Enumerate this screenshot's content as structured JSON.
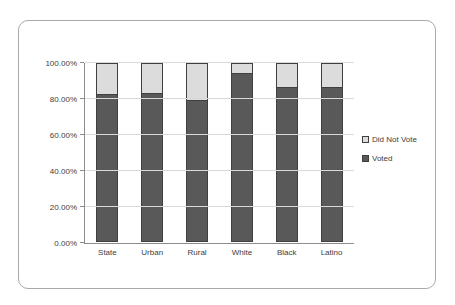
{
  "figure": {
    "kind": "embedded-chart-figure",
    "background_color": "#ffffff",
    "frame_border_color": "#a9a9a9"
  },
  "chart_data": {
    "type": "bar",
    "subtype": "stacked-100-percent",
    "title": "",
    "xlabel": "",
    "ylabel": "",
    "categories": [
      "State",
      "Urban",
      "Rural",
      "White",
      "Black",
      "Latino"
    ],
    "series": [
      {
        "name": "Voted",
        "color": "#595959",
        "values": [
          82,
          83,
          79,
          94,
          86,
          86
        ]
      },
      {
        "name": "Did Not Vote",
        "color": "#dcdcdc",
        "values": [
          18,
          17,
          21,
          6,
          14,
          14
        ]
      }
    ],
    "y_axis": {
      "min": 0,
      "max": 100,
      "step": 20,
      "tick_labels": [
        "0.00%",
        "20.00%",
        "40.00%",
        "60.00%",
        "80.00%",
        "100.00%"
      ]
    },
    "grid": true,
    "legend": {
      "position": "right",
      "entries": [
        {
          "label": "Did Not Vote",
          "color": "#dcdcdc"
        },
        {
          "label": "Voted",
          "color": "#595959"
        }
      ]
    },
    "colors": {
      "bar_border": "#404040",
      "gridline": "#d9d9d9",
      "axis_line": "#8c8c8c",
      "text": "#404040"
    }
  }
}
